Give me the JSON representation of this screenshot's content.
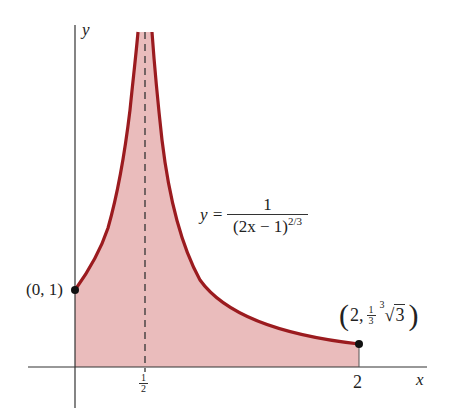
{
  "figure": {
    "axes": {
      "x_label": "x",
      "y_label": "y",
      "x_ticks": [
        {
          "value": 0.5,
          "label_num": "1",
          "label_den": "2"
        },
        {
          "value": 2,
          "label": "2"
        }
      ]
    },
    "equation": {
      "lhs": "y =",
      "numerator": "1",
      "denominator_base": "(2x − 1)",
      "denominator_exp": "2/3"
    },
    "points": [
      {
        "label": "(0, 1)",
        "x": 0,
        "y": 1
      },
      {
        "label_prefix": "2,",
        "coef_num": "1",
        "coef_den": "3",
        "root_index": "3",
        "radicand": "3",
        "x": 2,
        "y": 0.4807
      }
    ],
    "asymptote": {
      "x": 0.5,
      "style": "dashed"
    },
    "colors": {
      "curve": "#9b1b1f",
      "fill": "#e8b5b5",
      "axis": "#333333",
      "asymptote": "#333333",
      "point": "#111111"
    }
  }
}
